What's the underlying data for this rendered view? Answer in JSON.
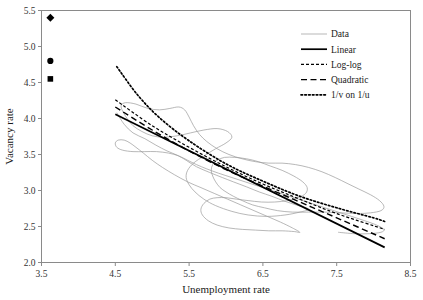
{
  "chart_data": {
    "type": "line",
    "title": "",
    "xlabel": "Unemployment rate",
    "ylabel": "Vacancy rate",
    "xlim": [
      3.5,
      8.5
    ],
    "ylim": [
      2.0,
      5.5
    ],
    "xticks": [
      "3.5",
      "4.5",
      "5.5",
      "6.5",
      "7.5",
      "8.5"
    ],
    "xtick_values": [
      3.5,
      4.5,
      5.5,
      6.5,
      7.5,
      8.5
    ],
    "yticks": [
      "2.0",
      "2.5",
      "3.0",
      "3.5",
      "4.0",
      "4.5",
      "5.0",
      "5.5"
    ],
    "ytick_values": [
      2.0,
      2.5,
      3.0,
      3.5,
      4.0,
      4.5,
      5.0,
      5.5
    ],
    "grid": false,
    "legend_position": "top-right",
    "legend": [
      {
        "label": "Data",
        "style": "solid-thin",
        "color": "#9a9a9a"
      },
      {
        "label": "Linear",
        "style": "solid-thick",
        "color": "#000000"
      },
      {
        "label": "Log-log",
        "style": "dash-short",
        "color": "#000000"
      },
      {
        "label": "Quadratic",
        "style": "dash-long",
        "color": "#000000"
      },
      {
        "label": "1/v on 1/u",
        "style": "dotted",
        "color": "#000000"
      }
    ],
    "series": [
      {
        "name": "Data",
        "style": "solid-thin",
        "color": "#9a9a9a",
        "type": "path",
        "points": [
          [
            4.52,
            4.08
          ],
          [
            4.62,
            3.92
          ],
          [
            4.74,
            3.8
          ],
          [
            4.9,
            3.72
          ],
          [
            5.05,
            3.63
          ],
          [
            5.2,
            3.55
          ],
          [
            5.34,
            3.49
          ],
          [
            5.46,
            3.42
          ],
          [
            5.6,
            3.33
          ],
          [
            5.78,
            3.25
          ],
          [
            5.95,
            3.18
          ],
          [
            6.1,
            3.12
          ],
          [
            6.28,
            3.05
          ],
          [
            6.45,
            2.98
          ],
          [
            6.62,
            2.92
          ],
          [
            6.8,
            2.85
          ],
          [
            6.98,
            2.79
          ],
          [
            7.12,
            2.74
          ],
          [
            7.0,
            2.7
          ],
          [
            6.8,
            2.66
          ],
          [
            6.55,
            2.64
          ],
          [
            6.3,
            2.66
          ],
          [
            6.08,
            2.71
          ],
          [
            5.86,
            2.79
          ],
          [
            5.7,
            2.88
          ],
          [
            5.58,
            2.98
          ],
          [
            5.5,
            3.08
          ],
          [
            5.46,
            3.18
          ],
          [
            5.48,
            3.28
          ],
          [
            5.56,
            3.38
          ],
          [
            5.7,
            3.48
          ],
          [
            5.86,
            3.58
          ],
          [
            6.0,
            3.66
          ],
          [
            6.08,
            3.74
          ],
          [
            6.02,
            3.82
          ],
          [
            5.88,
            3.86
          ],
          [
            5.7,
            3.84
          ],
          [
            5.52,
            3.8
          ],
          [
            5.34,
            3.76
          ],
          [
            5.16,
            3.74
          ],
          [
            5.0,
            3.76
          ],
          [
            4.86,
            3.82
          ],
          [
            4.74,
            3.9
          ],
          [
            4.66,
            4.0
          ],
          [
            4.6,
            4.1
          ],
          [
            4.58,
            4.18
          ],
          [
            4.64,
            4.22
          ],
          [
            4.78,
            4.2
          ],
          [
            4.94,
            4.14
          ],
          [
            5.1,
            4.12
          ],
          [
            5.24,
            4.14
          ],
          [
            5.36,
            4.16
          ],
          [
            5.44,
            4.12
          ],
          [
            5.5,
            4.02
          ],
          [
            5.56,
            3.9
          ],
          [
            5.64,
            3.78
          ],
          [
            5.74,
            3.68
          ],
          [
            5.88,
            3.58
          ],
          [
            6.04,
            3.5
          ],
          [
            6.22,
            3.44
          ],
          [
            6.4,
            3.4
          ],
          [
            6.58,
            3.38
          ],
          [
            6.76,
            3.38
          ],
          [
            6.94,
            3.36
          ],
          [
            7.12,
            3.32
          ],
          [
            7.3,
            3.26
          ],
          [
            7.48,
            3.18
          ],
          [
            7.64,
            3.1
          ],
          [
            7.8,
            3.02
          ],
          [
            7.96,
            2.94
          ],
          [
            8.08,
            2.86
          ],
          [
            8.14,
            2.78
          ],
          [
            8.1,
            2.72
          ],
          [
            7.96,
            2.69
          ],
          [
            7.78,
            2.68
          ],
          [
            7.56,
            2.69
          ],
          [
            7.34,
            2.7
          ],
          [
            7.12,
            2.7
          ],
          [
            6.9,
            2.7
          ],
          [
            6.7,
            2.72
          ],
          [
            6.52,
            2.76
          ],
          [
            6.36,
            2.8
          ],
          [
            6.22,
            2.86
          ],
          [
            6.1,
            2.92
          ],
          [
            6.0,
            2.98
          ],
          [
            5.92,
            3.04
          ],
          [
            5.86,
            3.12
          ],
          [
            5.82,
            3.2
          ],
          [
            5.8,
            3.28
          ],
          [
            5.82,
            3.36
          ],
          [
            5.88,
            3.42
          ],
          [
            5.98,
            3.46
          ],
          [
            6.12,
            3.46
          ],
          [
            6.28,
            3.44
          ],
          [
            6.44,
            3.4
          ],
          [
            6.6,
            3.34
          ],
          [
            6.76,
            3.28
          ],
          [
            6.92,
            3.2
          ],
          [
            7.04,
            3.12
          ],
          [
            7.1,
            3.04
          ],
          [
            7.08,
            2.96
          ],
          [
            6.98,
            2.9
          ],
          [
            6.84,
            2.86
          ],
          [
            6.66,
            2.84
          ],
          [
            6.48,
            2.84
          ],
          [
            6.3,
            2.86
          ],
          [
            6.14,
            2.88
          ],
          [
            6.0,
            2.9
          ],
          [
            5.88,
            2.9
          ],
          [
            5.78,
            2.88
          ],
          [
            5.7,
            2.82
          ],
          [
            5.66,
            2.74
          ],
          [
            5.68,
            2.66
          ],
          [
            5.76,
            2.58
          ],
          [
            5.88,
            2.52
          ],
          [
            6.04,
            2.48
          ],
          [
            6.22,
            2.46
          ],
          [
            6.4,
            2.45
          ],
          [
            6.58,
            2.44
          ],
          [
            6.76,
            2.44
          ],
          [
            6.92,
            2.43
          ],
          [
            7.0,
            2.42
          ],
          [
            6.9,
            2.48
          ],
          [
            6.74,
            2.56
          ],
          [
            6.56,
            2.64
          ],
          [
            6.38,
            2.72
          ],
          [
            6.2,
            2.8
          ],
          [
            6.02,
            2.88
          ],
          [
            5.84,
            2.96
          ],
          [
            5.66,
            3.04
          ],
          [
            5.48,
            3.12
          ],
          [
            5.3,
            3.22
          ],
          [
            5.14,
            3.32
          ],
          [
            5.0,
            3.42
          ],
          [
            4.88,
            3.52
          ],
          [
            4.78,
            3.6
          ],
          [
            4.7,
            3.66
          ],
          [
            4.62,
            3.7
          ],
          [
            4.54,
            3.7
          ],
          [
            4.5,
            3.66
          ],
          [
            4.52,
            3.6
          ],
          [
            4.6,
            3.56
          ],
          [
            4.74,
            3.54
          ],
          [
            4.9,
            3.54
          ],
          [
            5.06,
            3.54
          ],
          [
            5.22,
            3.52
          ],
          [
            5.36,
            3.48
          ],
          [
            5.48,
            3.42
          ],
          [
            5.6,
            3.36
          ],
          [
            5.74,
            3.3
          ],
          [
            5.9,
            3.24
          ],
          [
            6.08,
            3.18
          ],
          [
            6.26,
            3.12
          ],
          [
            6.44,
            3.06
          ],
          [
            6.62,
            3.0
          ],
          [
            6.8,
            2.94
          ],
          [
            6.98,
            2.88
          ],
          [
            7.16,
            2.82
          ],
          [
            7.34,
            2.76
          ],
          [
            7.52,
            2.7
          ],
          [
            7.7,
            2.64
          ],
          [
            7.88,
            2.58
          ],
          [
            8.04,
            2.52
          ],
          [
            8.14,
            2.46
          ],
          [
            8.1,
            2.42
          ],
          [
            7.94,
            2.4
          ],
          [
            7.74,
            2.4
          ],
          [
            7.52,
            2.42
          ]
        ]
      },
      {
        "name": "Linear",
        "style": "solid-thick",
        "color": "#000000",
        "type": "line",
        "endpoints": [
          [
            4.5,
            4.06
          ],
          [
            8.15,
            2.21
          ]
        ]
      },
      {
        "name": "Log-log",
        "style": "dash-short",
        "color": "#000000",
        "type": "curve",
        "points": [
          [
            4.5,
            4.26
          ],
          [
            5.0,
            3.9
          ],
          [
            5.5,
            3.6
          ],
          [
            6.0,
            3.33
          ],
          [
            6.5,
            3.09
          ],
          [
            7.0,
            2.88
          ],
          [
            7.5,
            2.68
          ],
          [
            8.15,
            2.46
          ]
        ]
      },
      {
        "name": "Quadratic",
        "style": "dash-long",
        "color": "#000000",
        "type": "curve",
        "points": [
          [
            4.5,
            4.16
          ],
          [
            5.0,
            3.84
          ],
          [
            5.5,
            3.55
          ],
          [
            6.0,
            3.29
          ],
          [
            6.5,
            3.06
          ],
          [
            7.0,
            2.84
          ],
          [
            7.5,
            2.62
          ],
          [
            8.15,
            2.33
          ]
        ]
      },
      {
        "name": "1/v on 1/u",
        "style": "dotted",
        "color": "#000000",
        "type": "curve",
        "points": [
          [
            4.52,
            4.72
          ],
          [
            4.8,
            4.33
          ],
          [
            5.1,
            4.01
          ],
          [
            5.5,
            3.69
          ],
          [
            6.0,
            3.37
          ],
          [
            6.5,
            3.13
          ],
          [
            7.0,
            2.92
          ],
          [
            7.5,
            2.76
          ],
          [
            8.0,
            2.62
          ],
          [
            8.15,
            2.57
          ]
        ]
      }
    ],
    "markers": [
      {
        "name": "diamond-marker",
        "x": 3.62,
        "y": 5.4,
        "shape": "diamond",
        "color": "#000000"
      },
      {
        "name": "circle-marker",
        "x": 3.62,
        "y": 4.8,
        "shape": "circle",
        "color": "#000000"
      },
      {
        "name": "square-marker",
        "x": 3.62,
        "y": 4.55,
        "shape": "square",
        "color": "#000000"
      }
    ]
  }
}
